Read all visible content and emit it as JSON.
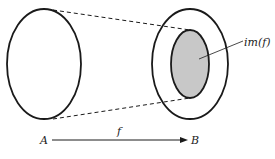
{
  "diagram": {
    "domain_label": "A",
    "codomain_label": "B",
    "map_label": "f",
    "image_label": "im(f)",
    "colors": {
      "stroke": "#1a1a1a",
      "image_fill": "#c8c8c8",
      "background": "#ffffff"
    }
  }
}
